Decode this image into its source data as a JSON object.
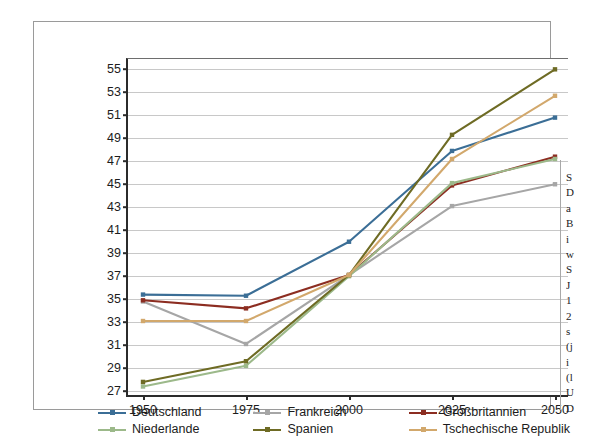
{
  "chart_data": {
    "type": "line",
    "title": "",
    "xlabel": "",
    "ylabel": "",
    "x": [
      1950,
      1975,
      2000,
      2025,
      2050
    ],
    "xticklabels": [
      "1950",
      "1975",
      "2000",
      "2025",
      "2050"
    ],
    "yticks": [
      27,
      29,
      31,
      33,
      35,
      37,
      39,
      41,
      43,
      45,
      47,
      49,
      51,
      53,
      55
    ],
    "yticklabels": [
      "27",
      "29",
      "31",
      "33",
      "35",
      "37",
      "39",
      "41",
      "43",
      "45",
      "47",
      "49",
      "51",
      "53",
      "55"
    ],
    "ylim": [
      26.4,
      55.9
    ],
    "grid": true,
    "legend_position": "bottom",
    "series": [
      {
        "name": "Deutschland",
        "color": "#3b6e96",
        "values": [
          35.4,
          35.3,
          40.0,
          47.9,
          50.8
        ]
      },
      {
        "name": "Frankreich",
        "color": "#a6a6a6",
        "values": [
          34.8,
          31.1,
          37.1,
          43.1,
          45.0
        ]
      },
      {
        "name": "Großbritannien",
        "color": "#8c2d21",
        "values": [
          34.9,
          34.2,
          37.1,
          44.9,
          47.4
        ]
      },
      {
        "name": "Niederlande",
        "color": "#9cb98a",
        "values": [
          27.4,
          29.2,
          37.0,
          45.1,
          47.2
        ]
      },
      {
        "name": "Spanien",
        "color": "#6e6b24",
        "values": [
          27.8,
          29.6,
          37.1,
          49.3,
          55.0
        ]
      },
      {
        "name": "Tschechische Republik",
        "color": "#d2a86c",
        "values": [
          33.1,
          33.1,
          37.1,
          47.2,
          52.7
        ]
      }
    ]
  },
  "legend": {
    "items": [
      {
        "label": "Deutschland",
        "color": "#3b6e96"
      },
      {
        "label": "Frankreich",
        "color": "#a6a6a6"
      },
      {
        "label": "Großbritannien",
        "color": "#8c2d21"
      },
      {
        "label": "Niederlande",
        "color": "#9cb98a"
      },
      {
        "label": "Spanien",
        "color": "#6e6b24"
      },
      {
        "label": "Tschechische Republik",
        "color": "#d2a86c"
      }
    ]
  },
  "side_caption": {
    "lines": [
      "S",
      "D",
      "a",
      "B",
      "i",
      "w",
      "S",
      "J",
      "1",
      "2",
      "s",
      "(j",
      "i",
      "(l",
      "U",
      "D"
    ]
  }
}
